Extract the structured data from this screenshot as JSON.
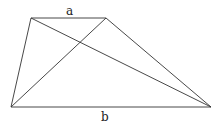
{
  "diagram": {
    "type": "trapezoid-with-diagonals",
    "labels": {
      "top_base": "a",
      "bottom_base": "b"
    },
    "vertices": {
      "top_left": [
        31,
        18
      ],
      "top_right": [
        106,
        18
      ],
      "bottom_left": [
        11,
        107
      ],
      "bottom_right": [
        211,
        107
      ]
    },
    "colors": {
      "stroke": "#333333",
      "background": "#ffffff"
    }
  }
}
